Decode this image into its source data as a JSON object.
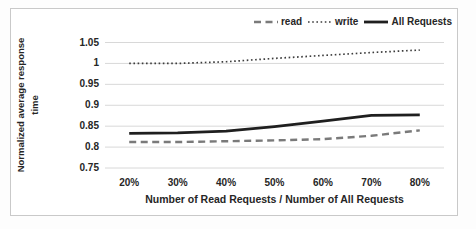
{
  "chart_data": {
    "type": "line",
    "categories": [
      "20%",
      "30%",
      "40%",
      "50%",
      "60%",
      "70%",
      "80%"
    ],
    "series": [
      {
        "name": "read",
        "style": "dashed",
        "color": "#7a7a7a",
        "values": [
          0.812,
          0.812,
          0.814,
          0.816,
          0.819,
          0.827,
          0.84
        ]
      },
      {
        "name": "write",
        "style": "dotted",
        "color": "#3d3d3d",
        "values": [
          1.0,
          1.0,
          1.004,
          1.012,
          1.019,
          1.026,
          1.032
        ]
      },
      {
        "name": "All Requests",
        "style": "solid",
        "color": "#1f1f1f",
        "values": [
          0.833,
          0.834,
          0.838,
          0.849,
          0.862,
          0.876,
          0.877
        ]
      }
    ],
    "title": "",
    "xlabel": "Number of Read Requests / Number of All Requests",
    "ylabel": "Normalized average response time",
    "ylabel_lines": [
      "Normalized average response",
      "time"
    ],
    "ylim": [
      0.75,
      1.05
    ],
    "yticks": [
      0.75,
      0.8,
      0.85,
      0.9,
      0.95,
      1,
      1.05
    ],
    "ytick_labels": [
      "0.75",
      "0.8",
      "0.85",
      "0.9",
      "0.95",
      "1",
      "1.05"
    ],
    "grid": "horizontal",
    "legend_position": "top-right",
    "colors": {
      "gridline": "#d8d8d8",
      "frame_border": "#c9c9c9",
      "text": "#262626"
    }
  }
}
